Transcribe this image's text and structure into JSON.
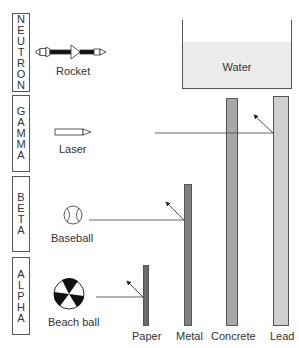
{
  "figure": {
    "title": "",
    "radiation_types": [
      {
        "name": "NEUTRON",
        "letters": [
          "N",
          "E",
          "U",
          "T",
          "R",
          "O",
          "N"
        ],
        "analogy": "Rocket"
      },
      {
        "name": "GAMMA",
        "letters": [
          "G",
          "A",
          "M",
          "M",
          "A"
        ],
        "analogy": "Laser"
      },
      {
        "name": "BETA",
        "letters": [
          "B",
          "E",
          "T",
          "A"
        ],
        "analogy": "Baseball"
      },
      {
        "name": "ALPHA",
        "letters": [
          "A",
          "L",
          "P",
          "H",
          "A"
        ],
        "analogy": "Beach ball"
      }
    ],
    "shields": [
      {
        "name": "Paper",
        "color": "#6b6b6b"
      },
      {
        "name": "Metal",
        "color": "#808080"
      },
      {
        "name": "Concrete",
        "color": "#a8a8a8"
      },
      {
        "name": "Lead",
        "color": "#cfcfcf"
      }
    ],
    "water": {
      "label": "Water",
      "color": "#ececec"
    }
  }
}
